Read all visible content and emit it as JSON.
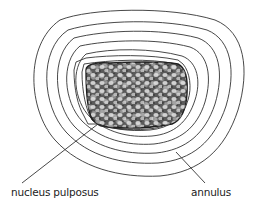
{
  "diagram": {
    "labels": {
      "nucleus": "nucleus pulposus",
      "annulus": "annulus"
    },
    "colors": {
      "line": "#333333",
      "nucleus_dark": "#3a3a3a",
      "nucleus_light": "#bdbdbd",
      "background": "#ffffff"
    },
    "annulus_ring_count": 7
  }
}
